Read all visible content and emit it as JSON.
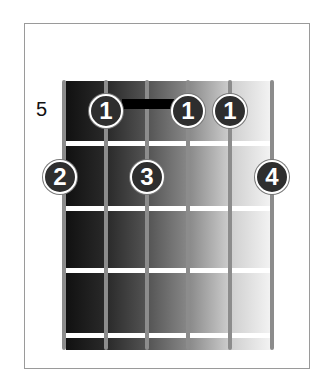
{
  "diagram": {
    "type": "chord-diagram",
    "starting_fret_label": "5",
    "strings": 6,
    "frets_shown": 4,
    "barre": {
      "finger": "1",
      "from_string": 2,
      "to_string": 4,
      "fret": 1
    },
    "fingers": [
      {
        "label": "1",
        "string": 2,
        "fret": 1
      },
      {
        "label": "1",
        "string": 4,
        "fret": 1
      },
      {
        "label": "1",
        "string": 5,
        "fret": 1
      },
      {
        "label": "2",
        "string": 1,
        "fret": 2
      },
      {
        "label": "3",
        "string": 3,
        "fret": 2
      },
      {
        "label": "4",
        "string": 6,
        "fret": 2
      }
    ]
  }
}
